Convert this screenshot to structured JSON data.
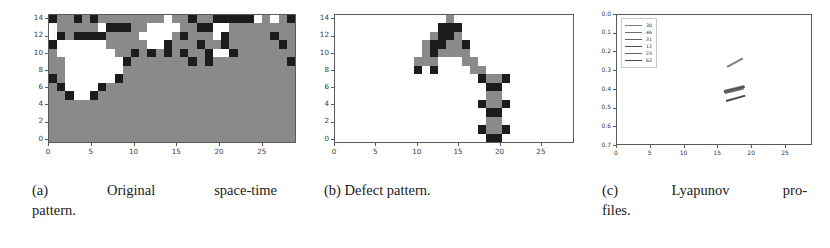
{
  "figure": {
    "panels": [
      {
        "id": "a",
        "caption_label": "(a)",
        "caption_text_line1": "Original space-time",
        "caption_text_line2": "pattern.",
        "caption_full": "(a) Original space-time pattern.",
        "xticks": [
          "0",
          "5",
          "10",
          "15",
          "20",
          "25"
        ],
        "yticks": [
          "0",
          "2",
          "4",
          "6",
          "8",
          "10",
          "12",
          "14"
        ],
        "xlim": [
          0,
          29
        ],
        "ylim": [
          14.5,
          -0.5
        ],
        "colors": {
          "background": "#8a8a8a",
          "state_on": "#1c1c1c",
          "state_off": "#ffffff"
        }
      },
      {
        "id": "b",
        "caption_label": "(b)",
        "caption_text_line1": "Defect pattern.",
        "caption_text_line2": "",
        "caption_full": "(b) Defect pattern.",
        "xticks": [
          "0",
          "5",
          "10",
          "15",
          "20",
          "25"
        ],
        "yticks": [
          "0",
          "2",
          "4",
          "6",
          "8",
          "10",
          "12",
          "14"
        ],
        "xlim": [
          0,
          29
        ],
        "ylim": [
          14.5,
          -0.5
        ],
        "colors": {
          "background": "#ffffff",
          "defect_dark": "#1c1c1c",
          "defect_mid": "#8a8a8a"
        }
      },
      {
        "id": "c",
        "caption_label": "(c)",
        "caption_text_line1": "Lyapunov pro-",
        "caption_text_line2": "files.",
        "caption_full": "(c) Lyapunov profiles.",
        "xticks": [
          "0",
          "5",
          "10",
          "15",
          "20",
          "25"
        ],
        "yticks": [
          "0.7",
          "0.6",
          "0.5",
          "0.4",
          "0.3",
          "0.2",
          "0.1",
          "0.0"
        ],
        "xlim": [
          0,
          29
        ],
        "ylim": [
          0.0,
          0.7
        ],
        "legend_title": "",
        "legend_entries": [
          {
            "label": "30",
            "color": "#808080"
          },
          {
            "label": "46",
            "color": "#707070"
          },
          {
            "label": "31",
            "color": "#606060"
          },
          {
            "label": "12",
            "color": "#505050"
          },
          {
            "label": "23",
            "color": "#686868"
          },
          {
            "label": "62",
            "color": "#4a4a4a"
          }
        ]
      }
    ]
  },
  "chart_data": [
    {
      "type": "heatmap",
      "title": "Original space-time pattern",
      "xlabel": "",
      "ylabel": "",
      "xlim": [
        0,
        29
      ],
      "ylim": [
        14.5,
        -0.5
      ],
      "grid": false,
      "legend_position": "none",
      "colormap_levels": {
        "0": "#ffffff",
        "1": "#8a8a8a",
        "2": "#1c1c1c"
      },
      "x": [
        0,
        1,
        2,
        3,
        4,
        5,
        6,
        7,
        8,
        9,
        10,
        11,
        12,
        13,
        14,
        15,
        16,
        17,
        18,
        19,
        20,
        21,
        22,
        23,
        24,
        25,
        26,
        27,
        28,
        29
      ],
      "y": [
        0,
        1,
        2,
        3,
        4,
        5,
        6,
        7,
        8,
        9,
        10,
        11,
        12,
        13,
        14
      ],
      "values": [
        [
          2,
          1,
          1,
          2,
          1,
          2,
          1,
          1,
          1,
          1,
          1,
          1,
          1,
          1,
          0,
          1,
          1,
          2,
          1,
          1,
          2,
          2,
          2,
          2,
          2,
          0,
          1,
          0,
          1,
          2
        ],
        [
          0,
          1,
          1,
          1,
          1,
          1,
          0,
          2,
          2,
          2,
          1,
          1,
          0,
          0,
          0,
          0,
          1,
          1,
          2,
          2,
          0,
          0,
          1,
          1,
          1,
          1,
          1,
          1,
          1,
          1
        ],
        [
          0,
          2,
          1,
          2,
          2,
          2,
          2,
          1,
          1,
          1,
          1,
          0,
          0,
          0,
          0,
          1,
          2,
          1,
          1,
          1,
          0,
          2,
          1,
          1,
          1,
          1,
          1,
          2,
          1,
          1
        ],
        [
          2,
          0,
          0,
          0,
          0,
          0,
          0,
          1,
          1,
          1,
          1,
          1,
          0,
          0,
          2,
          1,
          1,
          1,
          2,
          1,
          1,
          2,
          1,
          1,
          1,
          1,
          1,
          1,
          2,
          1
        ],
        [
          1,
          0,
          0,
          0,
          0,
          0,
          0,
          0,
          1,
          1,
          2,
          1,
          2,
          1,
          2,
          1,
          2,
          1,
          1,
          2,
          0,
          0,
          2,
          1,
          1,
          1,
          1,
          1,
          1,
          1
        ],
        [
          1,
          1,
          0,
          0,
          0,
          0,
          0,
          0,
          0,
          2,
          1,
          1,
          1,
          1,
          1,
          1,
          1,
          2,
          1,
          2,
          1,
          1,
          1,
          1,
          1,
          1,
          1,
          1,
          1,
          2
        ],
        [
          1,
          1,
          0,
          0,
          0,
          0,
          0,
          0,
          0,
          1,
          1,
          1,
          1,
          1,
          1,
          1,
          1,
          1,
          1,
          1,
          1,
          1,
          1,
          1,
          1,
          1,
          1,
          1,
          1,
          1
        ],
        [
          2,
          1,
          0,
          0,
          0,
          0,
          0,
          0,
          2,
          1,
          1,
          1,
          1,
          1,
          1,
          1,
          1,
          1,
          1,
          1,
          1,
          1,
          1,
          1,
          1,
          1,
          1,
          1,
          1,
          1
        ],
        [
          1,
          2,
          0,
          0,
          0,
          0,
          2,
          1,
          1,
          1,
          1,
          1,
          1,
          1,
          1,
          1,
          1,
          1,
          1,
          1,
          1,
          1,
          1,
          1,
          1,
          1,
          1,
          1,
          1,
          1
        ],
        [
          1,
          1,
          2,
          0,
          0,
          2,
          1,
          1,
          1,
          1,
          1,
          1,
          1,
          1,
          1,
          1,
          1,
          1,
          1,
          1,
          1,
          1,
          1,
          1,
          1,
          1,
          1,
          1,
          1,
          1
        ],
        [
          1,
          1,
          1,
          1,
          1,
          1,
          1,
          1,
          1,
          1,
          1,
          1,
          1,
          1,
          1,
          1,
          1,
          1,
          1,
          1,
          1,
          1,
          1,
          1,
          1,
          1,
          1,
          1,
          1,
          1
        ],
        [
          1,
          1,
          1,
          1,
          1,
          1,
          1,
          1,
          1,
          1,
          1,
          1,
          1,
          1,
          1,
          1,
          1,
          1,
          1,
          1,
          1,
          1,
          1,
          1,
          1,
          1,
          1,
          1,
          1,
          1
        ],
        [
          1,
          1,
          1,
          1,
          1,
          1,
          1,
          1,
          1,
          1,
          1,
          1,
          1,
          1,
          1,
          1,
          1,
          1,
          1,
          1,
          1,
          1,
          1,
          1,
          1,
          1,
          1,
          1,
          1,
          1
        ],
        [
          1,
          1,
          1,
          1,
          1,
          1,
          1,
          1,
          1,
          1,
          1,
          1,
          1,
          1,
          1,
          1,
          1,
          1,
          1,
          1,
          1,
          1,
          1,
          1,
          1,
          1,
          1,
          1,
          1,
          1
        ],
        [
          1,
          1,
          1,
          1,
          1,
          1,
          1,
          1,
          1,
          1,
          1,
          1,
          1,
          1,
          1,
          1,
          1,
          1,
          1,
          1,
          1,
          1,
          1,
          1,
          1,
          1,
          1,
          1,
          1,
          1
        ]
      ]
    },
    {
      "type": "heatmap",
      "title": "Defect pattern",
      "xlabel": "",
      "ylabel": "",
      "xlim": [
        0,
        29
      ],
      "ylim": [
        14.5,
        -0.5
      ],
      "grid": false,
      "legend_position": "none",
      "colormap_levels": {
        "0": "#ffffff",
        "1": "#8a8a8a",
        "2": "#1c1c1c"
      },
      "x": [
        0,
        1,
        2,
        3,
        4,
        5,
        6,
        7,
        8,
        9,
        10,
        11,
        12,
        13,
        14,
        15,
        16,
        17,
        18,
        19,
        20,
        21,
        22,
        23,
        24,
        25,
        26,
        27,
        28,
        29
      ],
      "y": [
        0,
        1,
        2,
        3,
        4,
        5,
        6,
        7,
        8,
        9,
        10,
        11,
        12,
        13,
        14
      ],
      "values": [
        [
          0,
          0,
          0,
          0,
          0,
          0,
          0,
          0,
          0,
          0,
          0,
          0,
          0,
          0,
          1,
          0,
          0,
          0,
          0,
          0,
          0,
          0,
          0,
          0,
          0,
          0,
          0,
          0,
          0,
          0
        ],
        [
          0,
          0,
          0,
          0,
          0,
          0,
          0,
          0,
          0,
          0,
          0,
          0,
          0,
          2,
          2,
          2,
          0,
          0,
          0,
          0,
          0,
          0,
          0,
          0,
          0,
          0,
          0,
          0,
          0,
          0
        ],
        [
          0,
          0,
          0,
          0,
          0,
          0,
          0,
          0,
          0,
          0,
          0,
          0,
          1,
          2,
          2,
          1,
          0,
          0,
          0,
          0,
          0,
          0,
          0,
          0,
          0,
          0,
          0,
          0,
          0,
          0
        ],
        [
          0,
          0,
          0,
          0,
          0,
          0,
          0,
          0,
          0,
          0,
          0,
          1,
          2,
          2,
          1,
          1,
          2,
          0,
          0,
          0,
          0,
          0,
          0,
          0,
          0,
          0,
          0,
          0,
          0,
          0
        ],
        [
          0,
          0,
          0,
          0,
          0,
          0,
          0,
          0,
          0,
          0,
          0,
          1,
          2,
          1,
          1,
          1,
          1,
          0,
          0,
          0,
          0,
          0,
          0,
          0,
          0,
          0,
          0,
          0,
          0,
          0
        ],
        [
          0,
          0,
          0,
          0,
          0,
          0,
          0,
          0,
          0,
          0,
          1,
          1,
          1,
          0,
          0,
          0,
          1,
          1,
          0,
          0,
          0,
          0,
          0,
          0,
          0,
          0,
          0,
          0,
          0,
          0
        ],
        [
          0,
          0,
          0,
          0,
          0,
          0,
          0,
          0,
          0,
          0,
          2,
          0,
          2,
          0,
          0,
          0,
          0,
          1,
          1,
          0,
          0,
          0,
          0,
          0,
          0,
          0,
          0,
          0,
          0,
          0
        ],
        [
          0,
          0,
          0,
          0,
          0,
          0,
          0,
          0,
          0,
          0,
          0,
          0,
          0,
          0,
          0,
          0,
          0,
          0,
          2,
          1,
          1,
          2,
          0,
          0,
          0,
          0,
          0,
          0,
          0,
          0
        ],
        [
          0,
          0,
          0,
          0,
          0,
          0,
          0,
          0,
          0,
          0,
          0,
          0,
          0,
          0,
          0,
          0,
          0,
          0,
          0,
          2,
          2,
          0,
          0,
          0,
          0,
          0,
          0,
          0,
          0,
          0
        ],
        [
          0,
          0,
          0,
          0,
          0,
          0,
          0,
          0,
          0,
          0,
          0,
          0,
          0,
          0,
          0,
          0,
          0,
          0,
          0,
          1,
          1,
          0,
          0,
          0,
          0,
          0,
          0,
          0,
          0,
          0
        ],
        [
          0,
          0,
          0,
          0,
          0,
          0,
          0,
          0,
          0,
          0,
          0,
          0,
          0,
          0,
          0,
          0,
          0,
          0,
          2,
          1,
          1,
          2,
          0,
          0,
          0,
          0,
          0,
          0,
          0,
          0
        ],
        [
          0,
          0,
          0,
          0,
          0,
          0,
          0,
          0,
          0,
          0,
          0,
          0,
          0,
          0,
          0,
          0,
          0,
          0,
          0,
          2,
          2,
          0,
          0,
          0,
          0,
          0,
          0,
          0,
          0,
          0
        ],
        [
          0,
          0,
          0,
          0,
          0,
          0,
          0,
          0,
          0,
          0,
          0,
          0,
          0,
          0,
          0,
          0,
          0,
          0,
          0,
          1,
          1,
          0,
          0,
          0,
          0,
          0,
          0,
          0,
          0,
          0
        ],
        [
          0,
          0,
          0,
          0,
          0,
          0,
          0,
          0,
          0,
          0,
          0,
          0,
          0,
          0,
          0,
          0,
          0,
          0,
          2,
          1,
          1,
          2,
          0,
          0,
          0,
          0,
          0,
          0,
          0,
          0
        ],
        [
          0,
          0,
          0,
          0,
          0,
          0,
          0,
          0,
          0,
          0,
          0,
          0,
          0,
          0,
          0,
          0,
          0,
          0,
          0,
          2,
          2,
          0,
          0,
          0,
          0,
          0,
          0,
          0,
          0,
          0
        ]
      ]
    },
    {
      "type": "line",
      "title": "Lyapunov profiles",
      "xlabel": "",
      "ylabel": "",
      "xlim": [
        0,
        29
      ],
      "ylim": [
        0.0,
        0.7
      ],
      "grid": false,
      "legend_position": "upper left",
      "series": [
        {
          "name": "30",
          "color": "#808080",
          "x": [
            16.3,
            18.6
          ],
          "y": [
            0.425,
            0.47
          ]
        },
        {
          "name": "46",
          "color": "#707070",
          "x": [
            15.9,
            18.9
          ],
          "y": [
            0.3,
            0.327
          ]
        },
        {
          "name": "31",
          "color": "#606060",
          "x": [
            15.9,
            18.9
          ],
          "y": [
            0.296,
            0.322
          ]
        },
        {
          "name": "12",
          "color": "#505050",
          "x": [
            15.9,
            18.9
          ],
          "y": [
            0.292,
            0.318
          ]
        },
        {
          "name": "23",
          "color": "#686868",
          "x": [
            16.0,
            18.8
          ],
          "y": [
            0.288,
            0.313
          ]
        },
        {
          "name": "62",
          "color": "#4a4a4a",
          "x": [
            16.1,
            19.0
          ],
          "y": [
            0.248,
            0.277
          ]
        }
      ]
    }
  ]
}
